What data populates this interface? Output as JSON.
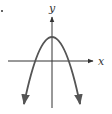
{
  "diagram": {
    "type": "function-graph",
    "axes": {
      "x_label": "x",
      "y_label": "y"
    },
    "curve": {
      "shape": "parabola",
      "opens": "down",
      "vertex_position": "on positive y-axis",
      "x_intercepts": 2
    },
    "colors": {
      "curve": "#555555",
      "axes": "#333333",
      "background": "#ffffff"
    }
  }
}
